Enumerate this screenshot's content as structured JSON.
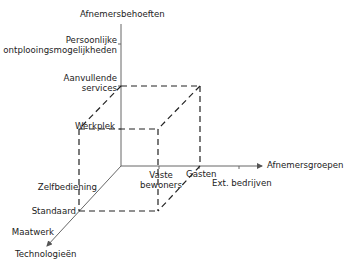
{
  "axes": {
    "vertical": {
      "title": "Afnemersbehoeften",
      "ticks": [
        "Persoonlijke ontplooingsmogelijkheden",
        "Aanvullende services",
        "Werkplek"
      ],
      "tick_lines": [
        [
          "Persoonlijke",
          "ontplooingsmogelijkheden"
        ],
        [
          "Aanvullende",
          "services"
        ],
        [
          "Werkplek"
        ]
      ]
    },
    "horizontal": {
      "title": "Afnemersgroepen",
      "ticks": [
        "Vaste bewoners",
        "Gasten",
        "Ext. bedrijven"
      ],
      "tick_lines": [
        [
          "Vaste",
          "bewoners"
        ],
        [
          "Gasten"
        ],
        [
          "Ext. bedrijven"
        ]
      ]
    },
    "diagonal": {
      "title": "Technologieën",
      "ticks": [
        "Zelfbediening",
        "Standaard",
        "Maatwerk"
      ]
    }
  },
  "colors": {
    "axis": "#555555",
    "dashed": "#222222"
  }
}
